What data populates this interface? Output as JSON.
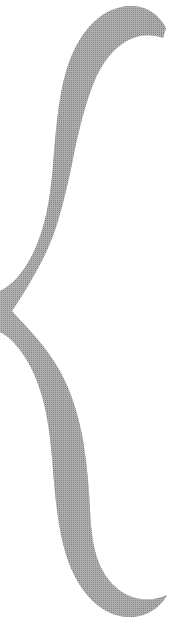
{
  "image": {
    "kind": "scanned-glyph",
    "subject": "left-curly-brace",
    "character": "{",
    "description": "Large left curly brace drawn as a thick tapering stroke",
    "width": 190,
    "height": 638,
    "background_color": "#ffffff",
    "ink_color": "#808080",
    "ink_texture": "50-percent-checkerboard-dither",
    "orientation": "vertical",
    "alt_text": "{"
  },
  "geometry": {
    "top_tip": {
      "x": 163,
      "y": 38
    },
    "upper_bowl_left_edge_x": 55,
    "upper_bowl_right_edge_x": 105,
    "middle_cusp": {
      "x": 12,
      "y": 312
    },
    "lower_bowl_right_edge_x": 110,
    "bottom_tip": {
      "x": 167,
      "y": 595
    },
    "max_stroke_width": 50,
    "min_stroke_width": 4
  }
}
